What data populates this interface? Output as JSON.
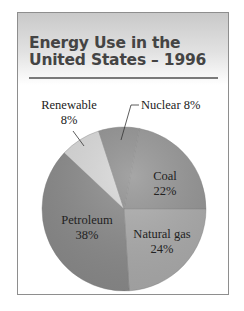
{
  "title": {
    "line1": "Energy Use in the",
    "line2": "United States – 1996"
  },
  "chart_data": {
    "type": "pie",
    "title": "Energy Use in the United States – 1996",
    "categories": [
      "Coal",
      "Natural gas",
      "Petroleum",
      "Renewable",
      "Nuclear"
    ],
    "values": [
      22,
      24,
      38,
      8,
      8
    ],
    "unit": "%",
    "colors": [
      "#939393",
      "#ababab",
      "#8a8a8a",
      "#d9d9d9",
      "#8f8f8f"
    ],
    "labels": {
      "coal": {
        "name": "Coal",
        "pct": "22%"
      },
      "natural_gas": {
        "name": "Natural gas",
        "pct": "24%"
      },
      "petroleum": {
        "name": "Petroleum",
        "pct": "38%"
      },
      "renewable": {
        "name": "Renewable",
        "pct": "8%"
      },
      "nuclear": {
        "name": "Nuclear 8%"
      }
    }
  }
}
